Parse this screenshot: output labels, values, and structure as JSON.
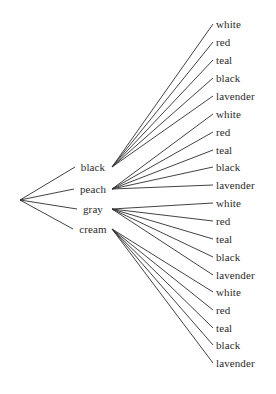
{
  "diagram": {
    "type": "tree",
    "title": "",
    "background_color": "#ffffff",
    "line_color": "#2e2e2e",
    "text_color": "#2b2b2b",
    "root": {
      "label": "",
      "x": 20,
      "y": 200
    },
    "level1": [
      {
        "label": "black",
        "x": 93,
        "y": 167,
        "fan_x": 112
      },
      {
        "label": "peach",
        "x": 93,
        "y": 189,
        "fan_x": 112
      },
      {
        "label": "gray",
        "x": 93,
        "y": 209,
        "fan_x": 112
      },
      {
        "label": "cream",
        "x": 93,
        "y": 229,
        "fan_x": 112
      }
    ],
    "leaves": [
      {
        "label": "white",
        "parent": "black",
        "x": 216,
        "y": 24
      },
      {
        "label": "red",
        "parent": "black",
        "x": 216,
        "y": 42
      },
      {
        "label": "teal",
        "parent": "black",
        "x": 216,
        "y": 60
      },
      {
        "label": "black",
        "parent": "black",
        "x": 216,
        "y": 78
      },
      {
        "label": "lavender",
        "parent": "black",
        "x": 216,
        "y": 96
      },
      {
        "label": "white",
        "parent": "peach",
        "x": 216,
        "y": 114
      },
      {
        "label": "red",
        "parent": "peach",
        "x": 216,
        "y": 132
      },
      {
        "label": "teal",
        "parent": "peach",
        "x": 216,
        "y": 150
      },
      {
        "label": "black",
        "parent": "peach",
        "x": 216,
        "y": 167
      },
      {
        "label": "lavender",
        "parent": "peach",
        "x": 216,
        "y": 185
      },
      {
        "label": "white",
        "parent": "gray",
        "x": 216,
        "y": 203
      },
      {
        "label": "red",
        "parent": "gray",
        "x": 216,
        "y": 221
      },
      {
        "label": "teal",
        "parent": "gray",
        "x": 216,
        "y": 239
      },
      {
        "label": "black",
        "parent": "gray",
        "x": 216,
        "y": 257
      },
      {
        "label": "lavender",
        "parent": "gray",
        "x": 216,
        "y": 275
      },
      {
        "label": "white",
        "parent": "cream",
        "x": 216,
        "y": 292
      },
      {
        "label": "red",
        "parent": "cream",
        "x": 216,
        "y": 310
      },
      {
        "label": "teal",
        "parent": "cream",
        "x": 216,
        "y": 328
      },
      {
        "label": "black",
        "parent": "cream",
        "x": 216,
        "y": 345
      },
      {
        "label": "lavender",
        "parent": "cream",
        "x": 216,
        "y": 363
      }
    ]
  }
}
